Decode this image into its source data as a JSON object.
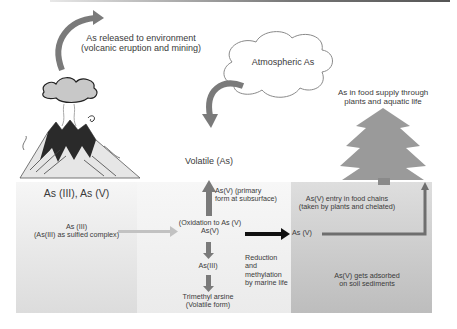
{
  "title_labels": {
    "release": [
      "As released to environment",
      "(volcanic eruption and mining)"
    ],
    "atmospheric": "Atmospheric As",
    "food_supply": [
      "As in food supply through",
      "plants and aquatic life"
    ],
    "volatile": "Volatile (As)"
  },
  "panels": {
    "left": {
      "heading": "As (III), As (V)",
      "body": [
        "As (III)",
        "(As(III) as sulfied complex)"
      ]
    },
    "middle": {
      "primary_form": [
        "As(V) (primary",
        "form at subsurface)"
      ],
      "oxidation": [
        "(Oxidation to As (V)",
        "As(V)"
      ],
      "as_iii": "As(III)",
      "trimethyl": [
        "Trimethyl arsine",
        "(Volatile form)"
      ],
      "reduction": [
        "Reduction",
        "and",
        "methylation",
        "by marine life"
      ]
    },
    "right": {
      "as_v": "As (V)",
      "entry": [
        "As(V) entry in food chains",
        "(taken by plants and chelated)"
      ],
      "adsorbed": [
        "As(V) gets adsorbed",
        "on soil sediments"
      ]
    }
  },
  "icons": {
    "volcano": "volcano-illustration",
    "cloud": "cloud-outline",
    "tree": "pine-tree-silhouette"
  },
  "colors": {
    "arrow_gray": "#7a7a7a",
    "arrow_black": "#111111",
    "tree": "#9a9a9a",
    "panel_right": "#c8c8c8"
  }
}
